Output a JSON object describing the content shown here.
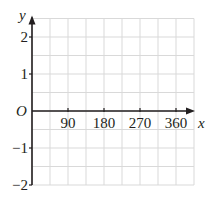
{
  "chart_data": {
    "type": "line",
    "title": "",
    "xlabel": "x",
    "ylabel": "y",
    "origin_label": "O",
    "xlim": [
      0,
      405
    ],
    "ylim": [
      -2,
      2.5
    ],
    "x_ticks": [
      90,
      180,
      270,
      360
    ],
    "x_tick_labels": [
      "90",
      "180",
      "270",
      "360"
    ],
    "y_ticks": [
      2,
      1,
      -1,
      -2
    ],
    "y_tick_labels": [
      "2",
      "1",
      "−1",
      "−2"
    ],
    "grid": true,
    "grid_x_step": 45,
    "grid_y_step": 0.5,
    "series": []
  },
  "colors": {
    "axis": "#231f20",
    "grid": "#d9d9d9",
    "background": "#ffffff"
  }
}
